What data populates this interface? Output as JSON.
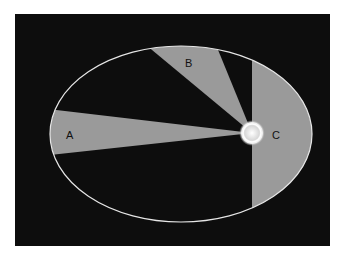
{
  "diagram": {
    "background_color": "#0d0d0d",
    "sector_color": "#9a9a9a",
    "orbit_color": "#e6e6e6",
    "sun_color": "#f2f2f2",
    "labels": {
      "A": "A",
      "B": "B",
      "C": "C"
    }
  }
}
